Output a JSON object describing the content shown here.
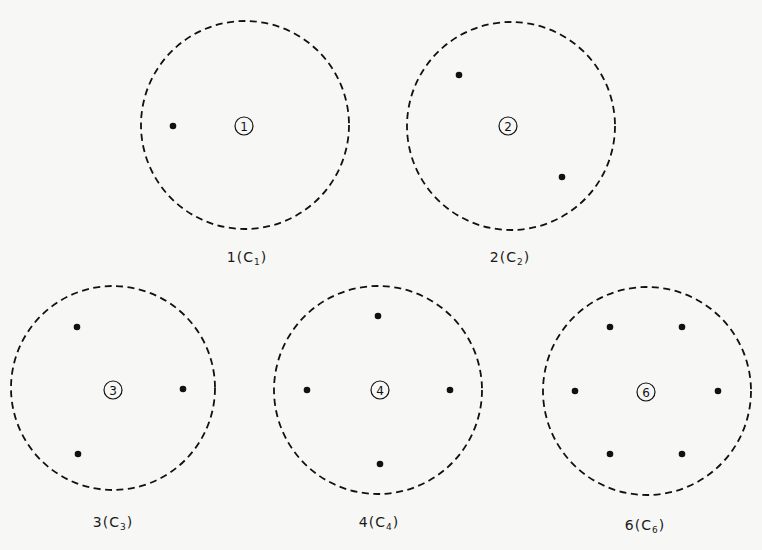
{
  "colors": {
    "background": "#f7f7f5",
    "ink": "#111111"
  },
  "figures": [
    {
      "id": "fold-1",
      "order": "1",
      "label_main": "1(C",
      "label_sub": "1",
      "label_end": ")",
      "center": [
        245,
        125
      ],
      "radius": 104,
      "symbol_pos": [
        244,
        126
      ],
      "label_pos": [
        247,
        258
      ],
      "points": [
        [
          173,
          126
        ]
      ]
    },
    {
      "id": "fold-2",
      "order": "2",
      "label_main": "2(C",
      "label_sub": "2",
      "label_end": ")",
      "center": [
        511,
        126
      ],
      "radius": 104,
      "symbol_pos": [
        508,
        126
      ],
      "label_pos": [
        510,
        258
      ],
      "points": [
        [
          459,
          75
        ],
        [
          562,
          177
        ]
      ]
    },
    {
      "id": "fold-3",
      "order": "3",
      "label_main": "3(C",
      "label_sub": "3",
      "label_end": ")",
      "center": [
        113,
        388
      ],
      "radius": 102,
      "symbol_pos": [
        113,
        390
      ],
      "label_pos": [
        113,
        523
      ],
      "points": [
        [
          77,
          327
        ],
        [
          183,
          389
        ],
        [
          78,
          454
        ]
      ]
    },
    {
      "id": "fold-4",
      "order": "4",
      "label_main": "4(C",
      "label_sub": "4",
      "label_end": ")",
      "center": [
        378,
        390
      ],
      "radius": 104,
      "symbol_pos": [
        380,
        390
      ],
      "label_pos": [
        379,
        523
      ],
      "points": [
        [
          378,
          316
        ],
        [
          307,
          390
        ],
        [
          450,
          390
        ],
        [
          380,
          464
        ]
      ]
    },
    {
      "id": "fold-6",
      "order": "6",
      "label_main": "6(C",
      "label_sub": "6",
      "label_end": ")",
      "center": [
        647,
        391
      ],
      "radius": 104,
      "symbol_pos": [
        646,
        392
      ],
      "label_pos": [
        645,
        526
      ],
      "points": [
        [
          610,
          327
        ],
        [
          682,
          327
        ],
        [
          575,
          391
        ],
        [
          718,
          391
        ],
        [
          610,
          454
        ],
        [
          682,
          454
        ]
      ]
    }
  ]
}
